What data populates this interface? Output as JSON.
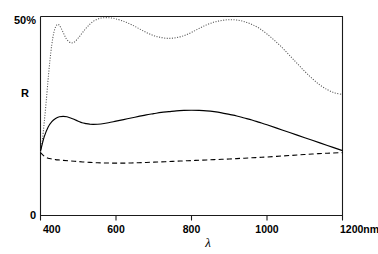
{
  "chart_data": {
    "type": "line",
    "title": "",
    "xlabel": "λ",
    "ylabel": "R",
    "xlim": [
      400,
      1200
    ],
    "ylim": [
      0,
      50
    ],
    "x_unit": "nm",
    "grid": false,
    "legend": "none",
    "y_tick_labels": [
      "50%",
      "0"
    ],
    "x_tick_labels": [
      "400",
      "600",
      "800",
      "1000",
      "1200nm"
    ],
    "x_ticks": [
      400,
      600,
      800,
      1000,
      1200
    ],
    "y_ticks": [
      0,
      50
    ],
    "series": [
      {
        "name": "dotted",
        "style": "dotted",
        "color": "#555555",
        "x": [
          400,
          405,
          410,
          415,
          420,
          425,
          430,
          435,
          440,
          445,
          450,
          455,
          460,
          465,
          470,
          480,
          490,
          500,
          510,
          520,
          530,
          540,
          550,
          560,
          570,
          580,
          590,
          600,
          620,
          640,
          660,
          680,
          700,
          720,
          740,
          760,
          780,
          800,
          820,
          840,
          860,
          880,
          900,
          920,
          940,
          960,
          980,
          1000,
          1020,
          1040,
          1060,
          1080,
          1100,
          1120,
          1140,
          1160,
          1180,
          1200
        ],
        "y": [
          16.0,
          19.0,
          23.5,
          28.5,
          34.0,
          39.0,
          43.0,
          45.8,
          47.4,
          48.0,
          47.8,
          47.0,
          46.0,
          45.0,
          44.2,
          43.4,
          43.6,
          44.6,
          45.8,
          47.0,
          48.0,
          48.8,
          49.3,
          49.6,
          49.7,
          49.7,
          49.6,
          49.4,
          48.8,
          48.0,
          47.0,
          46.0,
          45.2,
          44.7,
          44.5,
          44.7,
          45.2,
          46.0,
          47.0,
          47.9,
          48.6,
          49.0,
          49.2,
          49.1,
          48.7,
          48.0,
          47.0,
          45.6,
          44.0,
          42.2,
          40.2,
          38.2,
          36.2,
          34.4,
          32.8,
          31.6,
          30.8,
          30.4
        ]
      },
      {
        "name": "solid",
        "style": "solid",
        "color": "#000000",
        "x": [
          400,
          410,
          420,
          430,
          440,
          450,
          460,
          470,
          480,
          490,
          500,
          510,
          520,
          530,
          540,
          560,
          580,
          600,
          620,
          640,
          660,
          680,
          700,
          720,
          740,
          760,
          780,
          800,
          820,
          840,
          860,
          880,
          900,
          920,
          940,
          960,
          980,
          1000,
          1040,
          1080,
          1120,
          1160,
          1200
        ],
        "y": [
          16.2,
          19.8,
          22.2,
          23.6,
          24.4,
          24.8,
          24.9,
          24.8,
          24.5,
          24.1,
          23.7,
          23.3,
          23.1,
          22.95,
          22.9,
          23.0,
          23.3,
          23.7,
          24.1,
          24.5,
          24.9,
          25.3,
          25.6,
          25.9,
          26.1,
          26.3,
          26.4,
          26.45,
          26.4,
          26.3,
          26.1,
          25.8,
          25.4,
          25.0,
          24.5,
          24.0,
          23.4,
          22.8,
          21.5,
          20.2,
          18.9,
          17.6,
          16.3
        ]
      },
      {
        "name": "dashed",
        "style": "dashed",
        "color": "#000000",
        "x": [
          400,
          410,
          420,
          430,
          440,
          450,
          460,
          480,
          500,
          520,
          540,
          560,
          580,
          600,
          620,
          640,
          660,
          680,
          700,
          720,
          740,
          760,
          780,
          800,
          820,
          840,
          860,
          880,
          900,
          920,
          940,
          960,
          980,
          1000,
          1040,
          1080,
          1120,
          1160,
          1200
        ],
        "y": [
          15.8,
          14.9,
          14.4,
          14.2,
          14.05,
          13.95,
          13.85,
          13.7,
          13.55,
          13.4,
          13.3,
          13.22,
          13.18,
          13.15,
          13.16,
          13.2,
          13.26,
          13.33,
          13.4,
          13.48,
          13.56,
          13.64,
          13.72,
          13.8,
          13.88,
          13.96,
          14.04,
          14.12,
          14.2,
          14.3,
          14.4,
          14.5,
          14.6,
          14.7,
          14.95,
          15.2,
          15.45,
          15.65,
          15.8
        ]
      }
    ]
  },
  "labels": {
    "y_top": "50%",
    "y_bottom": "0",
    "y_axis_name": "R",
    "x_axis_name": "λ",
    "x_tick_400": "400",
    "x_tick_600": "600",
    "x_tick_800": "800",
    "x_tick_1000": "1000",
    "x_tick_1200": "1200nm"
  }
}
